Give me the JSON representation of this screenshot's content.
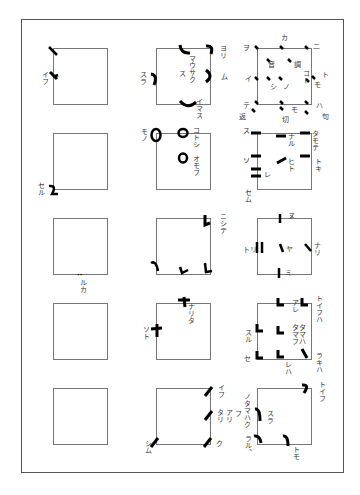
{
  "diagram": {
    "title": "",
    "grid": {
      "rows": 5,
      "cols": 3
    },
    "ink_color": "#000000",
    "line_color": "#777777",
    "cells": [
      {
        "row": 1,
        "col": 1,
        "labels": [
          "イフ"
        ]
      },
      {
        "row": 1,
        "col": 2,
        "labels": [
          "ヨリ",
          "スラ",
          "マウサク ス",
          "ム",
          "イマス"
        ]
      },
      {
        "row": 1,
        "col": 3,
        "labels": [
          "カ",
          "ニ",
          "ヲ",
          "音",
          "調",
          "コト",
          "ト",
          "イ",
          "シ",
          "ノ",
          "モ",
          "テ",
          "モ",
          "ハ",
          "返",
          "切",
          "句"
        ]
      },
      {
        "row": 2,
        "col": 1,
        "labels": [
          "セル"
        ]
      },
      {
        "row": 2,
        "col": 2,
        "labels": [
          "モノ",
          "コトシ",
          "オモフ"
        ]
      },
      {
        "row": 2,
        "col": 3,
        "labels": [
          "ス",
          "ナル",
          "タモテ",
          "ソ",
          "ヒト",
          "トキ",
          "レ",
          "セム"
        ]
      },
      {
        "row": 3,
        "col": 1,
        "labels": [
          "ルカ"
        ]
      },
      {
        "row": 3,
        "col": 2,
        "labels": [
          "ニシテ"
        ]
      },
      {
        "row": 3,
        "col": 3,
        "labels": [
          "ヌ",
          "トリ",
          "ヤ",
          "ナリ",
          "ミ"
        ]
      },
      {
        "row": 4,
        "col": 1,
        "labels": []
      },
      {
        "row": 4,
        "col": 2,
        "labels": [
          "ナリタ",
          "ソト"
        ]
      },
      {
        "row": 4,
        "col": 3,
        "labels": [
          "アレ",
          "トイフハ",
          "スル",
          "タタママフハ",
          "セ",
          "レハ",
          "ラキハ"
        ]
      },
      {
        "row": 5,
        "col": 1,
        "labels": []
      },
      {
        "row": 5,
        "col": 2,
        "labels": [
          "イフ",
          "アリ",
          "タリ",
          "シム",
          "ク"
        ]
      },
      {
        "row": 5,
        "col": 3,
        "labels": [
          "トイフ",
          "ノタマハクフ",
          "スラ",
          "ラル、",
          "トモ"
        ]
      }
    ]
  },
  "labels": {
    "r1c1_a": "イフ",
    "r1c2_yori": "ヨリ",
    "r1c2_sura": "スラ",
    "r1c2_mau": "マウサク",
    "r1c2_su": "ス",
    "r1c2_mu": "ム",
    "r1c2_imasu": "イマス",
    "r1c3_ka": "カ",
    "r1c3_ni": "ニ",
    "r1c3_wo": "ヲ",
    "r1c3_on": "音",
    "r1c3_cho": "調",
    "r1c3_koto": "コト",
    "r1c3_to": "ト",
    "r1c3_i": "イ",
    "r1c3_shi": "シ",
    "r1c3_no": "ノ",
    "r1c3_mo1": "モ",
    "r1c3_te": "テ",
    "r1c3_mo2": "モ",
    "r1c3_ha": "ハ",
    "r1c3_kaeri": "返",
    "r1c3_kiri": "切",
    "r1c3_ku": "句",
    "r2c1_seru": "セル",
    "r2c2_mono": "モノ",
    "r2c2_kotoshi": "コトシ",
    "r2c2_omofu": "オモフ",
    "r2c3_su": "ス",
    "r2c3_naru": "ナル",
    "r2c3_tamote": "タモテ",
    "r2c3_so": "ソ",
    "r2c3_hito": "ヒト",
    "r2c3_toki": "トキ",
    "r2c3_re": "レ",
    "r2c3_semu": "セム",
    "r3c1_ruka": "ルカ",
    "r3c2_nishite": "ニシテ",
    "r3c3_nu": "ヌ",
    "r3c3_tori": "トリ",
    "r3c3_ya": "ヤ",
    "r3c3_nari": "ナリ",
    "r3c3_mi": "ミ",
    "r4c2_narita": "ナリタ",
    "r4c2_soto": "ソト",
    "r4c3_are": "アレ",
    "r4c3_toifuha": "トイフハ",
    "r4c3_suru": "スル",
    "r4c3_tata": "タタ",
    "r4c3_mama": "ママ",
    "r4c3_fuha": "フハ",
    "r4c3_se": "セ",
    "r4c3_reha": "レハ",
    "r4c3_rakiha": "ラキハ",
    "r5c2_ifu": "イフ",
    "r5c2_ari": "アリ",
    "r5c2_tari": "タリ",
    "r5c2_shimu": "シム",
    "r5c2_ku": "ク",
    "r5c3_toifu": "トイフ",
    "r5c3_notamahaku": "ノタマハク",
    "r5c3_fu": "フ",
    "r5c3_sura": "スラ",
    "r5c3_raru": "ラル、",
    "r5c3_tomo": "トモ"
  }
}
